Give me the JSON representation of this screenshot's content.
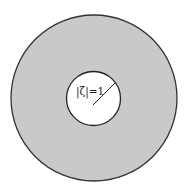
{
  "figure": {
    "outer_circle": {
      "cx": 94,
      "cy": 98,
      "r": 83,
      "fill": "#c9c9c9",
      "stroke": "#333333"
    },
    "inner_circle": {
      "cx": 93.5,
      "cy": 98.5,
      "r": 27,
      "fill": "#ffffff",
      "stroke": "#222222"
    },
    "radius_line": {
      "x1": 93,
      "y1": 105,
      "x2": 115,
      "y2": 83
    },
    "label": "|ζ|=1"
  }
}
